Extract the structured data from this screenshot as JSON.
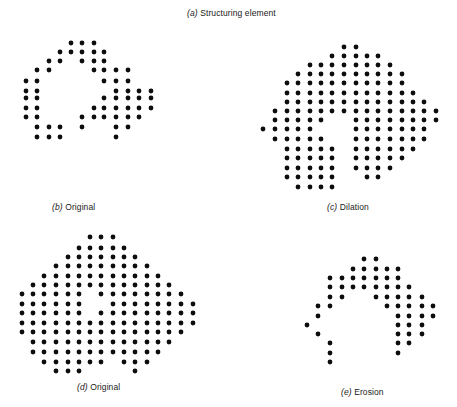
{
  "figure": {
    "title": {
      "letter": "a",
      "text": "Structuring element"
    },
    "panels": [
      {
        "id": "b",
        "label_letter": "b",
        "label_text": "Original",
        "label_pos": [
          52,
          202
        ],
        "cols": [
          26,
          37,
          49,
          60,
          71,
          82,
          94,
          104,
          116,
          128,
          139,
          151
        ],
        "rows": [
          43,
          52,
          61,
          70,
          81,
          91,
          98,
          108,
          117,
          127,
          137
        ],
        "grid": [
          [
            4,
            5,
            6
          ],
          [
            3,
            4,
            5,
            6,
            7
          ],
          [
            2,
            3,
            5,
            6,
            7
          ],
          [
            1,
            2,
            6,
            7,
            8,
            9
          ],
          [
            0,
            1,
            7,
            8,
            9
          ],
          [
            0,
            1,
            8,
            9,
            10,
            11
          ],
          [
            0,
            1,
            7,
            8,
            9,
            10,
            11
          ],
          [
            0,
            1,
            6,
            7,
            8,
            9,
            10,
            11
          ],
          [
            0,
            1,
            5,
            6,
            7,
            8,
            9,
            10
          ],
          [
            1,
            2,
            3,
            5,
            8,
            9
          ],
          [
            1,
            2,
            3,
            8
          ]
        ]
      },
      {
        "id": "c",
        "label_letter": "c",
        "label_text": "Dilation",
        "label_pos": [
          327,
          202
        ],
        "cols": [
          263,
          275,
          287,
          298,
          310,
          321,
          332,
          344,
          356,
          367,
          378,
          390,
          402,
          413,
          424,
          436
        ],
        "rows": [
          47,
          56,
          65,
          74,
          83,
          93,
          102,
          111,
          120,
          129,
          139,
          149,
          158,
          168,
          177,
          187
        ],
        "grid": [
          [
            7,
            8
          ],
          [
            6,
            7,
            8,
            9,
            10
          ],
          [
            4,
            5,
            6,
            7,
            8,
            9,
            10,
            11
          ],
          [
            3,
            4,
            5,
            6,
            7,
            8,
            9,
            10,
            11,
            12
          ],
          [
            2,
            3,
            4,
            5,
            6,
            7,
            8,
            9,
            10,
            11,
            12
          ],
          [
            2,
            3,
            4,
            5,
            6,
            7,
            8,
            9,
            10,
            11,
            12,
            13
          ],
          [
            2,
            3,
            4,
            5,
            6,
            7,
            8,
            9,
            10,
            11,
            12,
            13,
            14
          ],
          [
            1,
            2,
            3,
            4,
            5,
            6,
            7,
            8,
            9,
            10,
            11,
            12,
            13,
            14,
            15
          ],
          [
            1,
            2,
            3,
            4,
            5,
            8,
            9,
            10,
            11,
            12,
            13,
            14,
            15
          ],
          [
            0,
            1,
            2,
            3,
            4,
            8,
            9,
            10,
            11,
            12,
            13,
            14
          ],
          [
            1,
            2,
            3,
            4,
            5,
            8,
            9,
            10,
            11,
            12,
            13,
            14
          ],
          [
            2,
            3,
            4,
            5,
            6,
            8,
            9,
            10,
            11,
            12,
            13
          ],
          [
            2,
            3,
            4,
            5,
            6,
            8,
            9,
            10,
            11,
            12
          ],
          [
            2,
            3,
            4,
            5,
            6,
            8,
            9,
            10,
            11
          ],
          [
            2,
            3,
            4,
            5,
            6,
            9,
            10
          ],
          [
            3,
            4,
            5,
            6
          ]
        ]
      },
      {
        "id": "d",
        "label_letter": "d",
        "label_text": "Original",
        "label_pos": [
          77,
          382
        ],
        "cols": [
          22,
          33,
          44,
          56,
          68,
          79,
          90,
          101,
          113,
          124,
          135,
          147,
          158,
          169,
          181,
          193
        ],
        "rows": [
          237,
          248,
          257,
          266,
          276,
          285,
          294,
          304,
          313,
          323,
          332,
          342,
          352,
          362,
          371
        ],
        "grid": [
          [
            6,
            7,
            8
          ],
          [
            5,
            6,
            7,
            8,
            9
          ],
          [
            4,
            5,
            6,
            7,
            8,
            9,
            10
          ],
          [
            3,
            4,
            5,
            6,
            7,
            8,
            9,
            10,
            11
          ],
          [
            2,
            3,
            4,
            5,
            6,
            7,
            8,
            9,
            10,
            11,
            12
          ],
          [
            1,
            2,
            3,
            4,
            5,
            6,
            7,
            8,
            9,
            10,
            11,
            12,
            13
          ],
          [
            0,
            1,
            2,
            3,
            4,
            5,
            7,
            8,
            9,
            10,
            11,
            12,
            13,
            14
          ],
          [
            0,
            1,
            2,
            3,
            4,
            5,
            8,
            9,
            10,
            11,
            12,
            13,
            14,
            15
          ],
          [
            0,
            1,
            2,
            3,
            4,
            5,
            7,
            8,
            9,
            10,
            11,
            12,
            13,
            14,
            15
          ],
          [
            0,
            1,
            2,
            3,
            4,
            5,
            6,
            7,
            8,
            9,
            10,
            11,
            12,
            13,
            14,
            15
          ],
          [
            0,
            1,
            2,
            3,
            4,
            5,
            6,
            7,
            8,
            9,
            10,
            11,
            12,
            13,
            14
          ],
          [
            1,
            2,
            3,
            4,
            5,
            6,
            7,
            8,
            9,
            10,
            11,
            12,
            13
          ],
          [
            1,
            2,
            3,
            4,
            5,
            6,
            7,
            8,
            9,
            10,
            11,
            12
          ],
          [
            2,
            3,
            4,
            5,
            6,
            7,
            9,
            10,
            11
          ],
          [
            3,
            4,
            5,
            10
          ]
        ]
      },
      {
        "id": "e",
        "label_letter": "e",
        "label_text": "Erosion",
        "label_pos": [
          341,
          387
        ],
        "cols": [
          307,
          318,
          330,
          342,
          353,
          364,
          376,
          387,
          398,
          409,
          422,
          433
        ],
        "rows": [
          259,
          269,
          278,
          287,
          297,
          306,
          316,
          325,
          334,
          343,
          353,
          362
        ],
        "grid": [
          [
            5,
            6
          ],
          [
            4,
            5,
            6,
            7,
            8
          ],
          [
            2,
            3,
            4,
            5,
            6,
            7,
            8
          ],
          [
            2,
            3,
            4,
            5,
            6,
            7,
            8,
            9
          ],
          [
            2,
            3,
            6,
            7,
            8,
            9,
            10
          ],
          [
            1,
            2,
            7,
            8,
            9,
            10,
            11
          ],
          [
            1,
            8,
            9,
            10,
            11
          ],
          [
            0,
            8,
            9,
            10
          ],
          [
            1,
            8,
            9,
            10
          ],
          [
            2,
            8,
            9
          ],
          [
            2,
            8
          ],
          [
            2
          ]
        ]
      }
    ],
    "dot_color": "#0d0d0d",
    "dot_radius": 2.4
  }
}
